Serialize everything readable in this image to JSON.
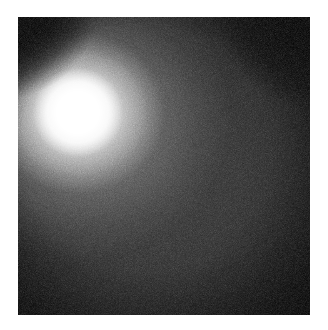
{
  "figure": {
    "domain": "natural-image",
    "kind": "grayscale-imaging-frame",
    "caption": "",
    "colors": {
      "page_background": "#ffffff",
      "frame_background": "#000000",
      "field_interior": "#2e2e2e",
      "glow_core": "#ffffff",
      "vignette": "#000000"
    },
    "geometry": {
      "canvas_width_px": 328,
      "canvas_height_px": 330,
      "frame_left_px": 18,
      "frame_top_px": 17,
      "frame_width_px": 292,
      "frame_height_px": 298,
      "margin_px": 18
    },
    "bright_spot": {
      "label": "saturated-highlight",
      "center_x_pct": 20.5,
      "center_y_pct": 32.0,
      "core_radius_pct": 15.5,
      "halo_radius_pct": 62.0,
      "peak_intensity": 255
    },
    "field_of_view": {
      "label": "circular-field-of-view",
      "center_x_pct": 46,
      "center_y_pct": 52,
      "radius_x_pct": 78,
      "radius_y_pct": 76,
      "interior_intensity": 46,
      "edge_intensity": 0
    },
    "noise": {
      "label": "sensor-grain",
      "type": "speckle",
      "strength": 0.5
    }
  }
}
